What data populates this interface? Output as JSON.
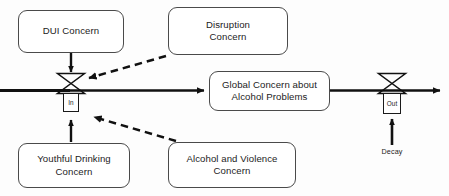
{
  "diagram": {
    "type": "stock-and-flow",
    "title": "",
    "background_color": "#fdfdfd",
    "line_color": "#111111",
    "box_border_color": "#4a4a4a",
    "text_color": "#1c1c1c",
    "stock": {
      "label": "Global Concern about\nAlcohol Problems"
    },
    "inflow": {
      "valve_label": "In",
      "caption": ""
    },
    "outflow": {
      "valve_label": "Out",
      "caption": "Decay"
    },
    "drivers": [
      {
        "id": "dui-concern",
        "label": "DUI Concern",
        "link_style": "solid",
        "target": "inflow"
      },
      {
        "id": "disruption-concern",
        "label": "Disruption\nConcern",
        "link_style": "dashed",
        "target": "inflow"
      },
      {
        "id": "youthful-drinking-concern",
        "label": "Youthful Drinking\nConcern",
        "link_style": "solid",
        "target": "inflow"
      },
      {
        "id": "alcohol-and-violence-concern",
        "label": "Alcohol and Violence\nConcern",
        "link_style": "dashed",
        "target": "inflow"
      }
    ]
  }
}
